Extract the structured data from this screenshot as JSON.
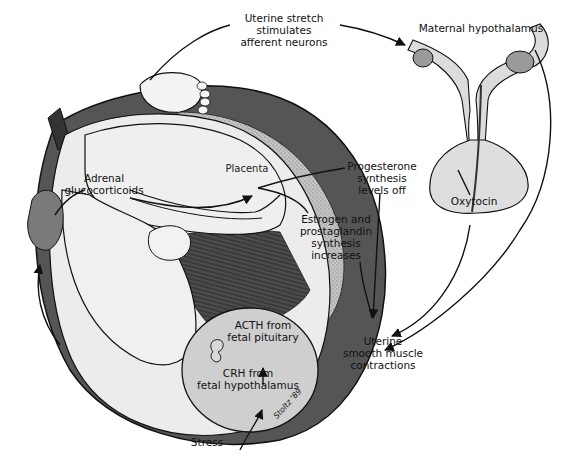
{
  "diagram": {
    "colors": {
      "uterus_wall": "#555555",
      "uterus_wall_dark": "#333333",
      "placenta": "#b9b9b9",
      "fetal_skin": "#ececec",
      "fetal_head": "#cfcfcf",
      "adrenal_gland": "#7a7a7a",
      "pituitary": "#dedede",
      "amniotic_shadow": "#3a3a3a",
      "line": "#111111"
    },
    "labels": {
      "uterine_stretch": [
        "Uterine stretch",
        "stimulates",
        "afferent neurons"
      ],
      "maternal_hypothalamus": "Maternal hypothalamus",
      "adrenal_glucocorticoids": [
        "Adrenal",
        "glucocorticoids"
      ],
      "placenta": "Placenta",
      "progesterone": [
        "Progesterone",
        "synthesis",
        "levels off"
      ],
      "estrogen": [
        "Estrogen and",
        "prostaglandin",
        "synthesis",
        "increases"
      ],
      "oxytocin": "Oxytocin",
      "acth": [
        "ACTH from",
        "fetal pituitary"
      ],
      "crh": [
        "CRH from",
        "fetal hypothalamus"
      ],
      "uterine_contractions": [
        "Uterine",
        "smooth muscle",
        "contractions"
      ],
      "stress": "Stress",
      "signature": "Stoltz '89"
    },
    "flow": [
      {
        "from": "Stress",
        "to": "CRH from fetal hypothalamus"
      },
      {
        "from": "CRH from fetal hypothalamus",
        "to": "ACTH from fetal pituitary"
      },
      {
        "from": "ACTH from fetal pituitary",
        "to": "Adrenal glucocorticoids"
      },
      {
        "from": "Adrenal glucocorticoids",
        "to": "Placenta"
      },
      {
        "from": "Placenta",
        "to": "Progesterone synthesis levels off"
      },
      {
        "from": "Placenta",
        "to": "Estrogen and prostaglandin synthesis increases"
      },
      {
        "from": "Estrogen and prostaglandin synthesis increases",
        "to": "Uterine smooth muscle contractions"
      },
      {
        "from": "Uterine stretch stimulates afferent neurons",
        "to": "Maternal hypothalamus"
      },
      {
        "from": "Maternal hypothalamus",
        "to": "Oxytocin"
      },
      {
        "from": "Oxytocin",
        "to": "Uterine smooth muscle contractions"
      }
    ]
  }
}
